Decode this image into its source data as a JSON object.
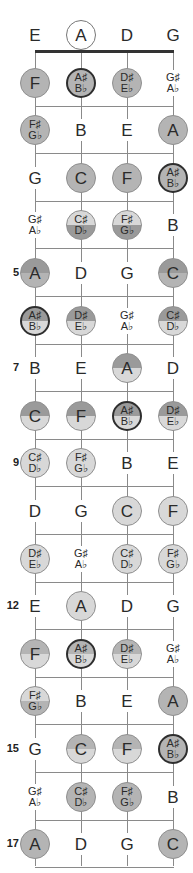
{
  "diagram": {
    "type": "fretboard",
    "strings": [
      "E",
      "A",
      "D",
      "G"
    ],
    "colors": {
      "open": "#ffffff",
      "medium": "#b4b4b4",
      "light": "#d8d8d8",
      "dark": "#9a9a9a",
      "line": "#8a8a8a"
    },
    "fret_numbers": [
      {
        "fret": 5,
        "label": "5"
      },
      {
        "fret": 7,
        "label": "7"
      },
      {
        "fret": 9,
        "label": "9"
      },
      {
        "fret": 12,
        "label": "12"
      },
      {
        "fret": 15,
        "label": "15"
      },
      {
        "fret": 17,
        "label": "17"
      }
    ],
    "frets": [
      [
        {
          "n": "E"
        },
        {
          "n": "A",
          "s": "open"
        },
        {
          "n": "D"
        },
        {
          "n": "G"
        }
      ],
      [
        {
          "n": "F",
          "s": "medium"
        },
        {
          "n": "A♯/B♭",
          "s": "medium",
          "b": "thick"
        },
        {
          "n": "D♯/E♭",
          "s": "medium"
        },
        {
          "n": "G♯/A♭"
        }
      ],
      [
        {
          "n": "F♯/G♭",
          "s": "medium"
        },
        {
          "n": "B"
        },
        {
          "n": "E"
        },
        {
          "n": "A",
          "s": "medium"
        }
      ],
      [
        {
          "n": "G"
        },
        {
          "n": "C",
          "s": "medium"
        },
        {
          "n": "F",
          "s": "medium"
        },
        {
          "n": "A♯/B♭",
          "s": "medium",
          "b": "thick"
        }
      ],
      [
        {
          "n": "G♯/A♭"
        },
        {
          "n": "C♯/D♭",
          "s": "medium-dark"
        },
        {
          "n": "F♯/G♭",
          "s": "medium-dark"
        },
        {
          "n": "B"
        }
      ],
      [
        {
          "n": "A",
          "s": "dark-medium"
        },
        {
          "n": "D"
        },
        {
          "n": "G"
        },
        {
          "n": "C",
          "s": "dark-medium"
        }
      ],
      [
        {
          "n": "A♯/B♭",
          "s": "dark-light",
          "b": "thick"
        },
        {
          "n": "D♯/E♭",
          "s": "dark-light"
        },
        {
          "n": "G♯/A♭"
        },
        {
          "n": "C♯/D♭",
          "s": "dark-light"
        }
      ],
      [
        {
          "n": "B"
        },
        {
          "n": "E"
        },
        {
          "n": "A",
          "s": "dark-light"
        },
        {
          "n": "D"
        }
      ],
      [
        {
          "n": "C",
          "s": "dark-light"
        },
        {
          "n": "F",
          "s": "dark-light"
        },
        {
          "n": "A♯/B♭",
          "s": "dark-light",
          "b": "thick"
        },
        {
          "n": "D♯/E♭",
          "s": "dark-light"
        }
      ],
      [
        {
          "n": "C♯/D♭",
          "s": "light"
        },
        {
          "n": "F♯/G♭",
          "s": "light"
        },
        {
          "n": "B"
        },
        {
          "n": "E"
        }
      ],
      [
        {
          "n": "D"
        },
        {
          "n": "G"
        },
        {
          "n": "C",
          "s": "light"
        },
        {
          "n": "F",
          "s": "light"
        }
      ],
      [
        {
          "n": "D♯/E♭",
          "s": "light"
        },
        {
          "n": "G♯/A♭"
        },
        {
          "n": "C♯/D♭",
          "s": "light"
        },
        {
          "n": "F♯/G♭",
          "s": "light"
        }
      ],
      [
        {
          "n": "E"
        },
        {
          "n": "A",
          "s": "light"
        },
        {
          "n": "D"
        },
        {
          "n": "G"
        }
      ],
      [
        {
          "n": "F",
          "s": "medium-light"
        },
        {
          "n": "A♯/B♭",
          "s": "medium-light",
          "b": "thick"
        },
        {
          "n": "D♯/E♭",
          "s": "medium-light"
        },
        {
          "n": "G♯/A♭"
        }
      ],
      [
        {
          "n": "F♯/G♭",
          "s": "light-medium"
        },
        {
          "n": "B"
        },
        {
          "n": "E"
        },
        {
          "n": "A",
          "s": "medium"
        }
      ],
      [
        {
          "n": "G"
        },
        {
          "n": "C",
          "s": "medium-light"
        },
        {
          "n": "F",
          "s": "medium-light"
        },
        {
          "n": "A♯/B♭",
          "s": "medium",
          "b": "thick"
        }
      ],
      [
        {
          "n": "G♯/A♭"
        },
        {
          "n": "C♯/D♭",
          "s": "medium"
        },
        {
          "n": "F♯/G♭",
          "s": "medium"
        },
        {
          "n": "B"
        }
      ],
      [
        {
          "n": "A",
          "s": "medium"
        },
        {
          "n": "D"
        },
        {
          "n": "G"
        },
        {
          "n": "C",
          "s": "medium"
        }
      ]
    ]
  }
}
